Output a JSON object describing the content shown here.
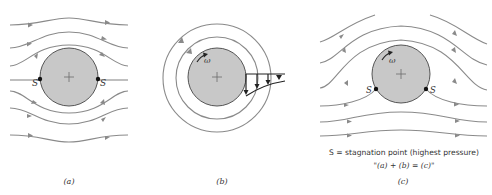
{
  "panels": [
    {
      "id": "a",
      "label": "(a)",
      "description": "Uniform flow past a non-rotating cylinder",
      "stagnation_labels": [
        "S",
        "S"
      ]
    },
    {
      "id": "b",
      "label": "(b)",
      "description": "Free vortex / circulation around rotating cylinder",
      "omega_label": "ω"
    },
    {
      "id": "c",
      "label": "(c)",
      "description": "Combined flow: uniform flow plus circulation",
      "omega_label": "ω",
      "stagnation_labels": [
        "S",
        "S"
      ]
    }
  ],
  "caption": {
    "line1": "S = stagnation point (highest pressure)",
    "line2": "\"(a) + (b) = (c)\""
  },
  "colors": {
    "cylinder_fill": "#c8c8c8",
    "streamline": "#8a8a8a",
    "stagnation_point": "#111111"
  }
}
